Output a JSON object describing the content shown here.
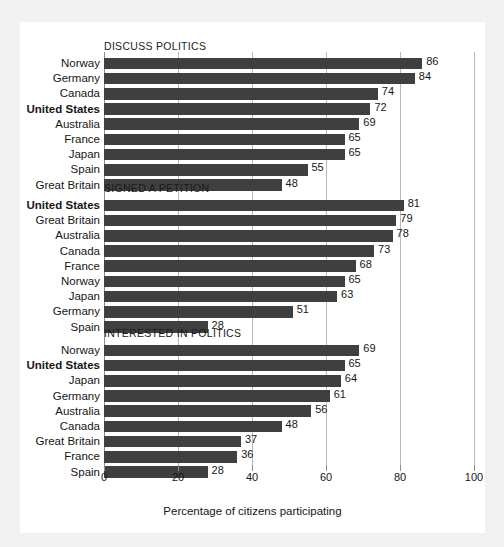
{
  "figure": {
    "x_axis_title": "Percentage of citizens participating",
    "panel_background": "#ffffff",
    "page_background": "#f1f1f1",
    "bar_color": "#3f3f3f",
    "highlight_country": "United States"
  },
  "chart_data": {
    "type": "bar",
    "orientation": "horizontal",
    "title": "",
    "xlabel": "Percentage of citizens participating",
    "ylabel": "",
    "xlim": [
      0,
      100
    ],
    "xticks": [
      0,
      20,
      40,
      60,
      80,
      100
    ],
    "xtick_labels": [
      "0",
      "20",
      "40",
      "60",
      "80",
      "100"
    ],
    "grid": "vertical",
    "legend": "none",
    "panels": [
      {
        "title": "DISCUSS POLITICS",
        "categories": [
          "Norway",
          "Germany",
          "Canada",
          "United States",
          "Australia",
          "France",
          "Japan",
          "Spain",
          "Great Britain"
        ],
        "values": [
          86,
          84,
          74,
          72,
          69,
          65,
          65,
          55,
          48
        ],
        "highlight": "United States"
      },
      {
        "title": "SIGNED A PETITION",
        "categories": [
          "United States",
          "Great Britain",
          "Australia",
          "Canada",
          "France",
          "Norway",
          "Japan",
          "Germany",
          "Spain"
        ],
        "values": [
          81,
          79,
          78,
          73,
          68,
          65,
          63,
          51,
          28
        ],
        "highlight": "United States"
      },
      {
        "title": "INTERESTED IN POLITICS",
        "categories": [
          "Norway",
          "United States",
          "Japan",
          "Germany",
          "Australia",
          "Canada",
          "Great Britain",
          "France",
          "Spain"
        ],
        "values": [
          69,
          65,
          64,
          61,
          56,
          48,
          37,
          36,
          28
        ],
        "highlight": "United States"
      }
    ]
  }
}
